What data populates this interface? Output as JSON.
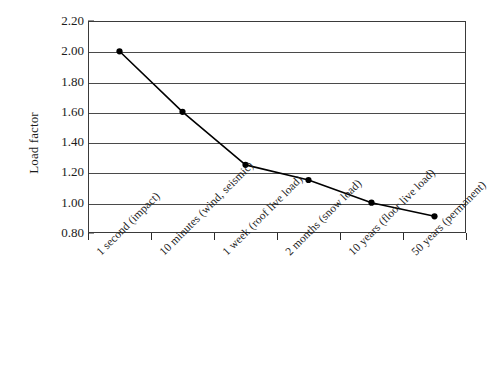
{
  "chart_data": {
    "type": "line",
    "title": "",
    "subtitle": "",
    "xlabel": "",
    "ylabel": "Load factor",
    "categories": [
      "1 second (impact)",
      "10 minutes (wind, seismic)",
      "1 week (roof live load)",
      "2 months (snow load)",
      "10 years (floor live load)",
      "50 years (permanent)"
    ],
    "values": [
      2.0,
      1.6,
      1.25,
      1.15,
      1.0,
      0.91
    ],
    "point_labels": [
      "2.00",
      "1.60",
      "1.25",
      "1.15",
      "1.00",
      "0.91"
    ],
    "ylim": [
      0.8,
      2.2
    ],
    "ytick_labels": [
      "2.20",
      "2.00",
      "1.80",
      "1.60",
      "1.40",
      "1.20",
      "1.00",
      "0.80"
    ],
    "ytick_values": [
      2.2,
      2.0,
      1.8,
      1.6,
      1.4,
      1.2,
      1.0,
      0.8
    ],
    "grid": true,
    "grid_axis": "y",
    "legend": false,
    "legend_position": "none",
    "series": [
      {
        "name": "Load factor",
        "values": [
          2.0,
          1.6,
          1.25,
          1.15,
          1.0,
          0.91
        ],
        "marker": "filled-circle",
        "line_color": "#000000",
        "marker_color": "#000000"
      }
    ],
    "annotations": []
  },
  "style": {
    "background": "#ffffff",
    "axis_color": "#3a3a3a",
    "grid_color": "#4a4a4a",
    "text_color": "#1b1b1b",
    "series_color": "#000000"
  }
}
